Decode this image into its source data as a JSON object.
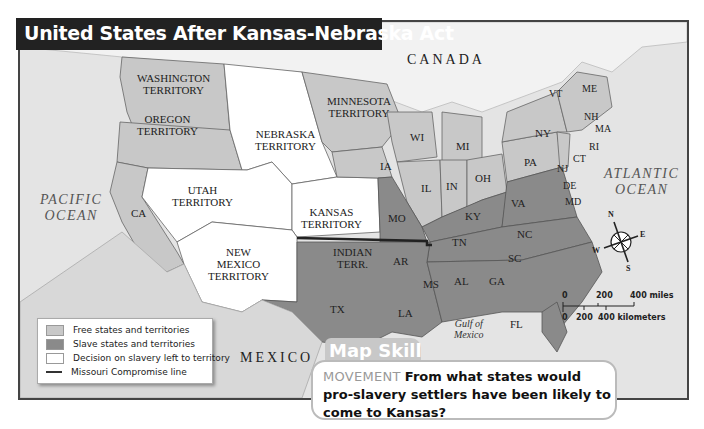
{
  "title": "United States After Kansas-Nebraska Act",
  "colors": {
    "free": "#c8c8c8",
    "slave": "#8a8a8a",
    "decision": "#ffffff",
    "ocean": "#e6e6e6",
    "frame": "#444444",
    "title_bg": "#222222",
    "missouri_line": "#222222"
  },
  "map_labels": {
    "territories": {
      "washington": "WASHINGTON\nTERRITORY",
      "oregon": "OREGON\nTERRITORY",
      "nebraska": "NEBRASKA\nTERRITORY",
      "minnesota": "MINNESOTA\nTERRITORY",
      "utah": "UTAH\nTERRITORY",
      "kansas": "KANSAS\nTERRITORY",
      "new_mexico": "NEW\nMEXICO\nTERRITORY",
      "indian": "INDIAN\nTERR."
    },
    "states": {
      "CA": "CA",
      "WI": "WI",
      "MI": "MI",
      "IA": "IA",
      "IL": "IL",
      "IN": "IN",
      "OH": "OH",
      "PA": "PA",
      "NY": "NY",
      "VT": "VT",
      "ME": "ME",
      "NH": "NH",
      "MA": "MA",
      "RI": "RI",
      "CT": "CT",
      "NJ": "NJ",
      "DE": "DE",
      "MD": "MD",
      "MO": "MO",
      "KY": "KY",
      "VA": "VA",
      "TN": "TN",
      "NC": "NC",
      "SC": "SC",
      "AR": "AR",
      "MS": "MS",
      "AL": "AL",
      "GA": "GA",
      "LA": "LA",
      "TX": "TX",
      "FL": "FL"
    },
    "regions": {
      "canada": "CANADA",
      "mexico": "MEXICO",
      "pacific": "PACIFIC\nOCEAN",
      "atlantic": "ATLANTIC\nOCEAN",
      "gulf": "Gulf of\nMexico"
    }
  },
  "legend": {
    "items": [
      {
        "label": "Free states and territories",
        "type": "free"
      },
      {
        "label": "Slave states and territories",
        "type": "slave"
      },
      {
        "label": "Decision on slavery left to territory",
        "type": "decision"
      },
      {
        "label": "Missouri Compromise line",
        "type": "line"
      }
    ]
  },
  "compass": {
    "n": "N",
    "s": "S",
    "e": "E",
    "w": "W"
  },
  "scale": {
    "miles": [
      "0",
      "200",
      "400 miles"
    ],
    "km": [
      "0",
      "200",
      "400 kilometers"
    ]
  },
  "map_skill": {
    "heading": "Map Skill",
    "keyword": "MOVEMENT",
    "question": "From what states would pro-slavery settlers have been likely to come to Kansas?"
  }
}
